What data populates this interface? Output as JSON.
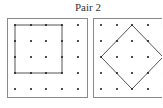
{
  "title": "Pair 2",
  "colors": {
    "border": "#8a8a8a",
    "dot": "#222222",
    "shape": "#555555"
  },
  "panels": [
    {
      "name": "left-geoboard",
      "grid": {
        "cols": 5,
        "rows": 5
      },
      "shape": "square",
      "shape_vertices_grid": [
        [
          0,
          0
        ],
        [
          3,
          0
        ],
        [
          3,
          3
        ],
        [
          0,
          3
        ]
      ]
    },
    {
      "name": "right-geoboard",
      "grid": {
        "cols": 5,
        "rows": 5
      },
      "shape": "diamond",
      "shape_vertices_grid": [
        [
          2,
          0
        ],
        [
          4,
          2
        ],
        [
          2,
          4
        ],
        [
          0,
          2
        ]
      ]
    }
  ]
}
